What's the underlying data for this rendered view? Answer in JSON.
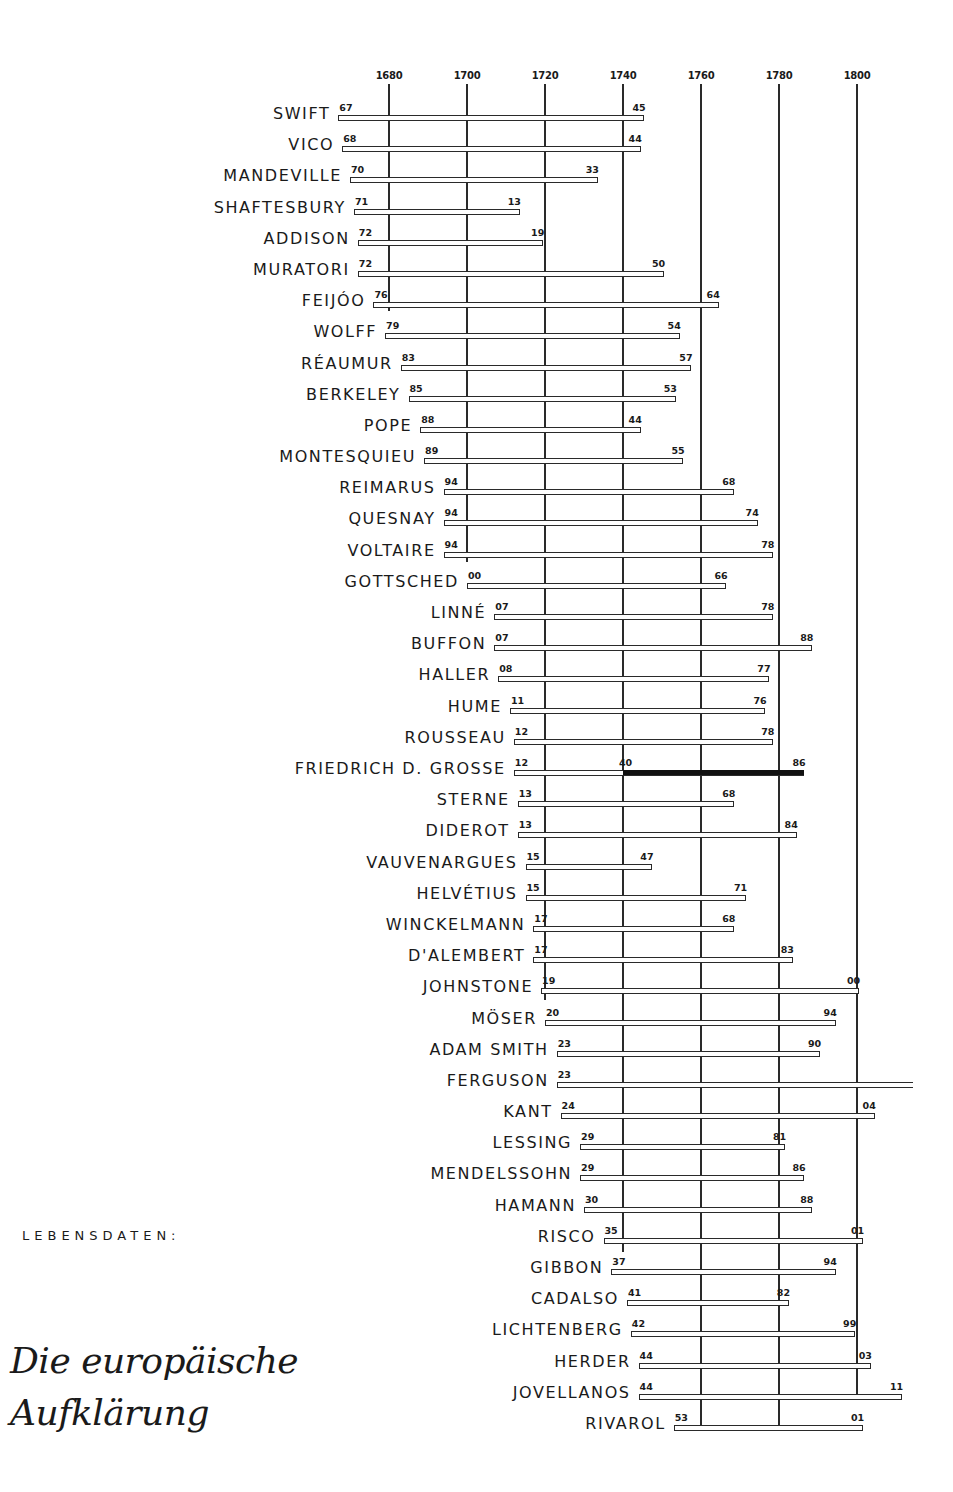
{
  "caption": "LEBENSDATEN:",
  "title_line1": "Die europäische",
  "title_line2": "Aufklärung",
  "chart_data": {
    "type": "timeline",
    "subtitle": "LEBENSDATEN:",
    "xlabel": "",
    "ylabel": "",
    "x_ticks": [
      1680,
      1700,
      1720,
      1740,
      1760,
      1780,
      1800
    ],
    "xlim": [
      1667,
      1813
    ],
    "grid": true,
    "rows": [
      {
        "name": "SWIFT",
        "birth": 1667,
        "death": 1745,
        "birth_label": "67",
        "death_label": "45"
      },
      {
        "name": "VICO",
        "birth": 1668,
        "death": 1744,
        "birth_label": "68",
        "death_label": "44"
      },
      {
        "name": "MANDEVILLE",
        "birth": 1670,
        "death": 1733,
        "birth_label": "70",
        "death_label": "33"
      },
      {
        "name": "SHAFTESBURY",
        "birth": 1671,
        "death": 1713,
        "birth_label": "71",
        "death_label": "13"
      },
      {
        "name": "ADDISON",
        "birth": 1672,
        "death": 1719,
        "birth_label": "72",
        "death_label": "19"
      },
      {
        "name": "MURATORI",
        "birth": 1672,
        "death": 1750,
        "birth_label": "72",
        "death_label": "50"
      },
      {
        "name": "FEIJÓO",
        "birth": 1676,
        "death": 1764,
        "birth_label": "76",
        "death_label": "64"
      },
      {
        "name": "WOLFF",
        "birth": 1679,
        "death": 1754,
        "birth_label": "79",
        "death_label": "54"
      },
      {
        "name": "RÉAUMUR",
        "birth": 1683,
        "death": 1757,
        "birth_label": "83",
        "death_label": "57"
      },
      {
        "name": "BERKELEY",
        "birth": 1685,
        "death": 1753,
        "birth_label": "85",
        "death_label": "53"
      },
      {
        "name": "POPE",
        "birth": 1688,
        "death": 1744,
        "birth_label": "88",
        "death_label": "44"
      },
      {
        "name": "MONTESQUIEU",
        "birth": 1689,
        "death": 1755,
        "birth_label": "89",
        "death_label": "55"
      },
      {
        "name": "REIMARUS",
        "birth": 1694,
        "death": 1768,
        "birth_label": "94",
        "death_label": "68"
      },
      {
        "name": "QUESNAY",
        "birth": 1694,
        "death": 1774,
        "birth_label": "94",
        "death_label": "74"
      },
      {
        "name": "VOLTAIRE",
        "birth": 1694,
        "death": 1778,
        "birth_label": "94",
        "death_label": "78"
      },
      {
        "name": "GOTTSCHED",
        "birth": 1700,
        "death": 1766,
        "birth_label": "00",
        "death_label": "66"
      },
      {
        "name": "LINNÉ",
        "birth": 1707,
        "death": 1778,
        "birth_label": "07",
        "death_label": "78"
      },
      {
        "name": "BUFFON",
        "birth": 1707,
        "death": 1788,
        "birth_label": "07",
        "death_label": "88"
      },
      {
        "name": "HALLER",
        "birth": 1708,
        "death": 1777,
        "birth_label": "08",
        "death_label": "77"
      },
      {
        "name": "HUME",
        "birth": 1711,
        "death": 1776,
        "birth_label": "11",
        "death_label": "76"
      },
      {
        "name": "ROUSSEAU",
        "birth": 1712,
        "death": 1778,
        "birth_label": "12",
        "death_label": "78"
      },
      {
        "name": "FRIEDRICH D. GROSSE",
        "birth": 1712,
        "death": 1786,
        "birth_label": "12",
        "death_label": "86",
        "reign_start": 1740,
        "reign_label": "40"
      },
      {
        "name": "STERNE",
        "birth": 1713,
        "death": 1768,
        "birth_label": "13",
        "death_label": "68"
      },
      {
        "name": "DIDEROT",
        "birth": 1713,
        "death": 1784,
        "birth_label": "13",
        "death_label": "84"
      },
      {
        "name": "VAUVENARGUES",
        "birth": 1715,
        "death": 1747,
        "birth_label": "15",
        "death_label": "47"
      },
      {
        "name": "HELVÉTIUS",
        "birth": 1715,
        "death": 1771,
        "birth_label": "15",
        "death_label": "71"
      },
      {
        "name": "WINCKELMANN",
        "birth": 1717,
        "death": 1768,
        "birth_label": "17",
        "death_label": "68"
      },
      {
        "name": "D'ALEMBERT",
        "birth": 1717,
        "death": 1783,
        "birth_label": "17",
        "death_label": "83"
      },
      {
        "name": "JOHNSTONE",
        "birth": 1719,
        "death": 1800,
        "birth_label": "19",
        "death_label": "00"
      },
      {
        "name": "MÖSER",
        "birth": 1720,
        "death": 1794,
        "birth_label": "20",
        "death_label": "94"
      },
      {
        "name": "ADAM SMITH",
        "birth": 1723,
        "death": 1790,
        "birth_label": "23",
        "death_label": "90"
      },
      {
        "name": "FERGUSON",
        "birth": 1723,
        "death": 1816,
        "birth_label": "23",
        "death_label": ""
      },
      {
        "name": "KANT",
        "birth": 1724,
        "death": 1804,
        "birth_label": "24",
        "death_label": "04"
      },
      {
        "name": "LESSING",
        "birth": 1729,
        "death": 1781,
        "birth_label": "29",
        "death_label": "81"
      },
      {
        "name": "MENDELSSOHN",
        "birth": 1729,
        "death": 1786,
        "birth_label": "29",
        "death_label": "86"
      },
      {
        "name": "HAMANN",
        "birth": 1730,
        "death": 1788,
        "birth_label": "30",
        "death_label": "88"
      },
      {
        "name": "RISCO",
        "birth": 1735,
        "death": 1801,
        "birth_label": "35",
        "death_label": "01"
      },
      {
        "name": "GIBBON",
        "birth": 1737,
        "death": 1794,
        "birth_label": "37",
        "death_label": "94"
      },
      {
        "name": "CADALSO",
        "birth": 1741,
        "death": 1782,
        "birth_label": "41",
        "death_label": "82"
      },
      {
        "name": "LICHTENBERG",
        "birth": 1742,
        "death": 1799,
        "birth_label": "42",
        "death_label": "99"
      },
      {
        "name": "HERDER",
        "birth": 1744,
        "death": 1803,
        "birth_label": "44",
        "death_label": "03"
      },
      {
        "name": "JOVELLANOS",
        "birth": 1744,
        "death": 1811,
        "birth_label": "44",
        "death_label": "11"
      },
      {
        "name": "RIVAROL",
        "birth": 1753,
        "death": 1801,
        "birth_label": "53",
        "death_label": "01"
      }
    ]
  }
}
